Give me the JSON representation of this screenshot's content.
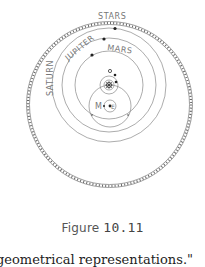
{
  "figure": {
    "labels": {
      "stars": "STARS",
      "saturn": "SATURN",
      "jupiter": "JUPITER",
      "mars": "MARS",
      "moon": "M",
      "earth": "E"
    },
    "colors": {
      "line": "#888888",
      "dot": "#222222"
    }
  },
  "caption": {
    "prefix": "Figure",
    "number": "10.11"
  },
  "body_text": "geometrical representations.\""
}
